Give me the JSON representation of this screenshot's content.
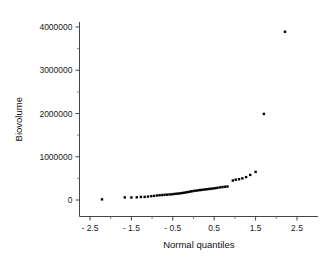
{
  "chart_data": {
    "type": "scatter",
    "title": "",
    "subtitle": "",
    "xlabel": "Normal quantiles",
    "ylabel": "Biovolume",
    "xlim": [
      -2.9,
      2.75
    ],
    "ylim": [
      -260000,
      4380000
    ],
    "grid": false,
    "legend": null,
    "x_ticks": [
      -2.5,
      -1.5,
      -0.5,
      0.5,
      1.5,
      2.5
    ],
    "x_tick_labels": [
      "- 2.5",
      "- 1.5",
      "- 0.5",
      "0.5",
      "1.5",
      "2.5"
    ],
    "x_minor_ticks": [
      -2.0,
      -1.0,
      0.0,
      1.0,
      2.0
    ],
    "y_ticks": [
      0,
      1000000,
      2000000,
      3000000,
      4000000
    ],
    "y_tick_labels": [
      "0",
      "1000000",
      "2000000",
      "3000000",
      "4000000"
    ],
    "y_minor_ticks": [
      500000,
      1500000,
      2500000,
      3500000
    ],
    "marker": "square",
    "marker_color": "#000000",
    "marker_size": 2.4,
    "series": [
      {
        "name": "Biovolume",
        "points": [
          [
            -2.21,
            15000
          ],
          [
            -1.66,
            60000
          ],
          [
            -1.5,
            58000
          ],
          [
            -1.37,
            62000
          ],
          [
            -1.27,
            70000
          ],
          [
            -1.18,
            72000
          ],
          [
            -1.1,
            80000
          ],
          [
            -1.02,
            88000
          ],
          [
            -0.95,
            96000
          ],
          [
            -0.88,
            104000
          ],
          [
            -0.82,
            110000
          ],
          [
            -0.76,
            115000
          ],
          [
            -0.7,
            120000
          ],
          [
            -0.64,
            124000
          ],
          [
            -0.58,
            128000
          ],
          [
            -0.53,
            132000
          ],
          [
            -0.48,
            138000
          ],
          [
            -0.43,
            143000
          ],
          [
            -0.38,
            148000
          ],
          [
            -0.33,
            153000
          ],
          [
            -0.28,
            160000
          ],
          [
            -0.23,
            168000
          ],
          [
            -0.18,
            176000
          ],
          [
            -0.14,
            184000
          ],
          [
            -0.09,
            192000
          ],
          [
            -0.05,
            200000
          ],
          [
            0.0,
            208000
          ],
          [
            0.05,
            215000
          ],
          [
            0.09,
            220000
          ],
          [
            0.14,
            228000
          ],
          [
            0.18,
            232000
          ],
          [
            0.23,
            238000
          ],
          [
            0.28,
            244000
          ],
          [
            0.33,
            250000
          ],
          [
            0.38,
            256000
          ],
          [
            0.43,
            262000
          ],
          [
            0.48,
            268000
          ],
          [
            0.53,
            274000
          ],
          [
            0.58,
            282000
          ],
          [
            0.64,
            292000
          ],
          [
            0.7,
            300000
          ],
          [
            0.76,
            306000
          ],
          [
            0.82,
            312000
          ],
          [
            0.95,
            450000
          ],
          [
            1.02,
            470000
          ],
          [
            1.1,
            480000
          ],
          [
            1.18,
            500000
          ],
          [
            1.27,
            530000
          ],
          [
            1.37,
            580000
          ],
          [
            1.5,
            650000
          ],
          [
            1.7,
            1990000
          ],
          [
            2.21,
            3890000
          ]
        ]
      }
    ]
  }
}
